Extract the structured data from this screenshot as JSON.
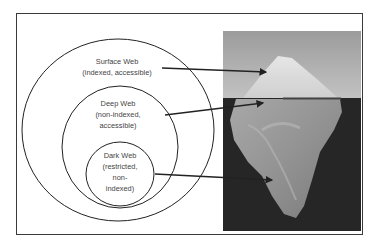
{
  "diagram": {
    "title": "",
    "layers": [
      {
        "id": "surface",
        "lines": [
          "Surface Web",
          "(indexed, accessible)"
        ]
      },
      {
        "id": "deep",
        "lines": [
          "Deep Web",
          "(non-indexed,",
          "accessible)"
        ]
      },
      {
        "id": "dark",
        "lines": [
          "Dark Web",
          "(restricted,",
          "non-",
          "indexed)"
        ]
      }
    ],
    "image": {
      "subject": "iceberg",
      "description": "Iceberg photo with tip above waterline and large mass below"
    },
    "colors": {
      "line": "#222222",
      "text": "#444444",
      "sky": "#a9a9a9",
      "water": "#262626"
    }
  }
}
